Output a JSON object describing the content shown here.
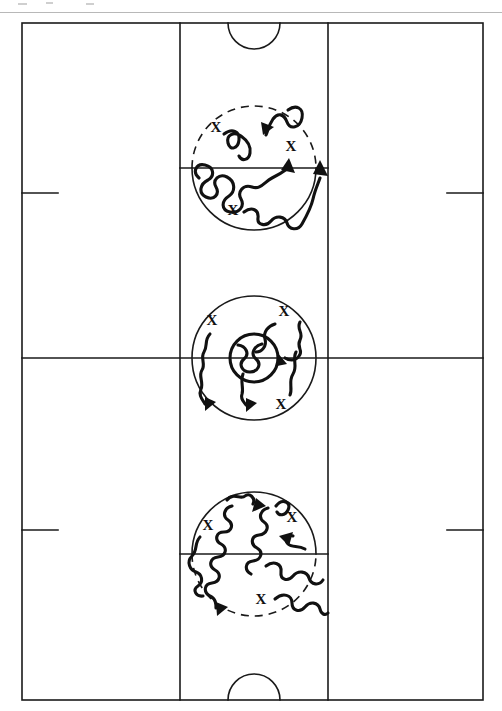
{
  "document": {
    "title": "Basketball Court Dribbling Drill Diagram",
    "type": "sports-play-diagram",
    "sport": "basketball",
    "orientation": "vertical-full-court",
    "width": 502,
    "height": 711,
    "background_color": "#ffffff",
    "ink_color": "#111111",
    "line_color": "#1a1a1a"
  },
  "court": {
    "label": "full-court",
    "boundary": {
      "left": 22,
      "top": 23,
      "right": 483,
      "bottom": 700
    },
    "lane_left_x": 180,
    "lane_right_x": 328,
    "half_court_line_y": 358,
    "free_throw_line_top_y": 168,
    "free_throw_line_bottom_y": 554,
    "free_throw_circle_radius": 62,
    "center_circle_radius": 62,
    "center_inner_circle_radius": 24,
    "basket_arc_radius": 26,
    "hash_mark_top_y": 193,
    "hash_mark_bottom_y": 530,
    "hash_mark_length": 36
  },
  "zones": [
    {
      "name": "top-key-zone",
      "label": "Top free throw circle drill",
      "circle_center": {
        "x": 254,
        "y": 168
      },
      "dashed_half": "top",
      "players": [
        {
          "id": "x1",
          "symbol": "X",
          "x": 216,
          "y": 129
        },
        {
          "id": "x2",
          "symbol": "X",
          "x": 291,
          "y": 148
        },
        {
          "id": "x3",
          "symbol": "X",
          "x": 233,
          "y": 212
        }
      ],
      "path_count": 4
    },
    {
      "name": "center-circle-zone",
      "label": "Center jump circle drill",
      "circle_center": {
        "x": 254,
        "y": 358
      },
      "dashed_half": "none",
      "players": [
        {
          "id": "x4",
          "symbol": "X",
          "x": 212,
          "y": 322
        },
        {
          "id": "x5",
          "symbol": "X",
          "x": 284,
          "y": 313
        },
        {
          "id": "x6",
          "symbol": "X",
          "x": 281,
          "y": 406
        }
      ],
      "path_count": 4
    },
    {
      "name": "bottom-key-zone",
      "label": "Bottom free throw circle drill",
      "circle_center": {
        "x": 254,
        "y": 554
      },
      "dashed_half": "bottom",
      "players": [
        {
          "id": "x7",
          "symbol": "X",
          "x": 208,
          "y": 527
        },
        {
          "id": "x8",
          "symbol": "X",
          "x": 292,
          "y": 519
        },
        {
          "id": "x9",
          "symbol": "X",
          "x": 261,
          "y": 601
        }
      ],
      "path_count": 5
    }
  ],
  "legend": {
    "player_symbol": "X",
    "player_symbol_meaning": "player position",
    "wavy_line_meaning": "dribble path",
    "arrow_meaning": "direction of travel"
  }
}
